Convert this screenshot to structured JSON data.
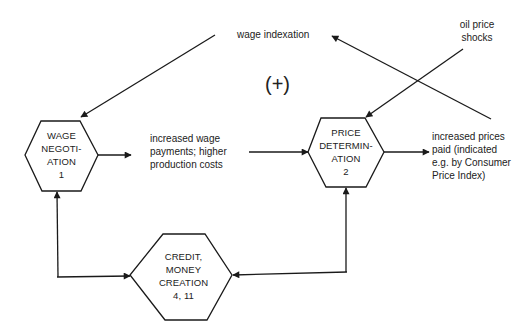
{
  "diagram": {
    "type": "feedback-loop flow diagram",
    "loop_sign": "(+)",
    "nodes": [
      {
        "id": "wage_negotiation",
        "lines": [
          "WAGE",
          "NEGOTI-",
          "ATION",
          "1"
        ]
      },
      {
        "id": "price_determination",
        "lines": [
          "PRICE",
          "DETERMIN-",
          "ATION",
          "2"
        ]
      },
      {
        "id": "credit_money_creation",
        "lines": [
          "CREDIT,",
          "MONEY",
          "CREATION",
          "4, 11"
        ]
      }
    ],
    "labels": {
      "wage_indexation": "wage indexation",
      "oil_price_shocks": [
        "oil price",
        "shocks"
      ],
      "increased_wage_payments": [
        "increased wage",
        "payments; higher",
        "production costs"
      ],
      "increased_prices": [
        "increased prices",
        "paid (indicated",
        "e.g. by Consumer",
        "Price Index)"
      ]
    },
    "edges": [
      {
        "from": "wage_indexation",
        "to": "wage_negotiation"
      },
      {
        "from": "wage_negotiation",
        "to": "increased_wage_payments"
      },
      {
        "from": "increased_wage_payments",
        "to": "price_determination"
      },
      {
        "from": "oil_price_shocks",
        "to": "price_determination"
      },
      {
        "from": "price_determination",
        "to": "increased_prices"
      },
      {
        "from": "increased_prices",
        "to": "wage_indexation"
      },
      {
        "from": "credit_money_creation",
        "to": "wage_negotiation"
      },
      {
        "from": "wage_negotiation",
        "to": "credit_money_creation"
      },
      {
        "from": "credit_money_creation",
        "to": "price_determination"
      },
      {
        "from": "price_determination",
        "to": "credit_money_creation"
      }
    ]
  }
}
